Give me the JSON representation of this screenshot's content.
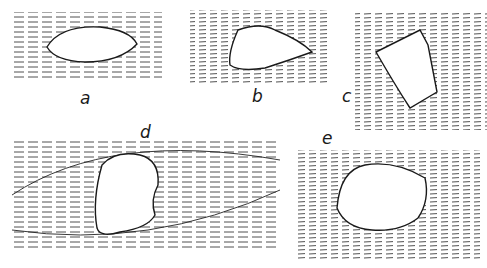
{
  "figure": {
    "panels": [
      {
        "id": "a",
        "label": "a",
        "description": "lens-shaped clast with symmetric foliation wrapping"
      },
      {
        "id": "b",
        "label": "b",
        "description": "asymmetric clast with tail to the right"
      },
      {
        "id": "c",
        "label": "c",
        "description": "rotated rectangular clast with deflected foliation"
      },
      {
        "id": "d",
        "label": "d",
        "description": "large clast in elongated lens of folded foliation"
      },
      {
        "id": "e",
        "label": "e",
        "description": "rounded clast with swirling foliation"
      }
    ],
    "colors": {
      "ink": "#1a1a1a",
      "background": "#ffffff"
    }
  }
}
